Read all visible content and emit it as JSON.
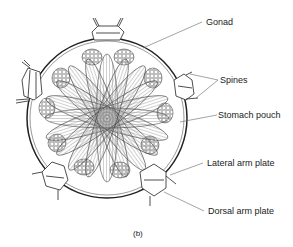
{
  "figure": {
    "caption": "(b)",
    "labels": {
      "gonad": "Gonad",
      "spines": "Spines",
      "stomach_pouch": "Stomach pouch",
      "lateral_arm_plate": "Lateral arm plate",
      "dorsal_arm_plate": "Dorsal arm plate"
    }
  }
}
